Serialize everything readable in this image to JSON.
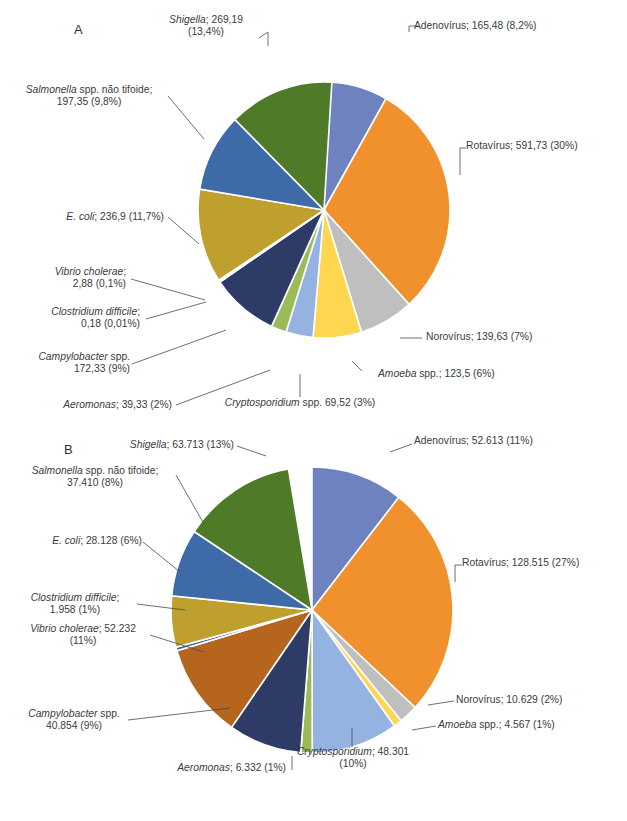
{
  "figure": {
    "background": "#ffffff",
    "caption": ""
  },
  "panels": [
    {
      "id": "A",
      "letter": "A",
      "letter_pos": {
        "x": 74,
        "y": 28
      }
    },
    {
      "id": "B",
      "letter": "B",
      "letter_pos": {
        "x": 64,
        "y": 448
      }
    }
  ],
  "chart_data": [
    {
      "type": "pie",
      "title": "A",
      "label_format": "name; value (percent)",
      "legend": "callout-labels",
      "grid": false,
      "total_percent": 100,
      "categories": [
        "Adenovírus",
        "Rotavírus",
        "Norovírus",
        "Amoeba spp.",
        "Cryptosporidium spp.",
        "Aeromonas",
        "Campylobacter spp.",
        "Clostridium difficile",
        "Vibrio cholerae",
        "E. coli",
        "Salmonella spp. não tifoide",
        "Shigella"
      ],
      "values": [
        165.48,
        591.73,
        139.63,
        123.5,
        69.52,
        39.33,
        172.33,
        0.18,
        2.88,
        236.9,
        197.35,
        269.19
      ],
      "percents": [
        "8,2%",
        "30%",
        "7%",
        "6%",
        "3%",
        "2%",
        "9%",
        "0,01%",
        "0,1%",
        "11,7%",
        "9,8%",
        "13,4%"
      ],
      "colors": [
        "#6E82C0",
        "#F0912D",
        "#BFBFBF",
        "#FFD64F",
        "#95B3E0",
        "#9BBB59",
        "#2E3B66",
        "#4F6AA0",
        "#7E98C8",
        "#BFA02E",
        "#3F6AA8",
        "#4F7B28"
      ],
      "slices": [
        {
          "name": "Adenovírus",
          "value": "165,48",
          "percent": "8,2%",
          "color": "#6E82C0",
          "sweep": 29.5
        },
        {
          "name": "Rotavírus",
          "value": "591,73",
          "percent": "30%",
          "color": "#F0912D",
          "sweep": 108.0
        },
        {
          "name": "Norovírus",
          "value": "139,63",
          "percent": "7%",
          "color": "#BFBFBF",
          "sweep": 25.2
        },
        {
          "name": "Amoeba spp.",
          "value": "123,5",
          "percent": "6%",
          "color": "#FFD64F",
          "sweep": 22.3
        },
        {
          "name": "Cryptosporidium spp.",
          "value": "69,52",
          "percent": "3%",
          "color": "#95B3E0",
          "sweep": 12.5
        },
        {
          "name": "Aeromonas",
          "value": "39,33",
          "percent": "2%",
          "color": "#9BBB59",
          "sweep": 7.1
        },
        {
          "name": "Campylobacter spp.",
          "value": "172,33",
          "percent": "9%",
          "color": "#2E3B66",
          "sweep": 31.1
        },
        {
          "name": "Clostridium difficile",
          "value": "0,18",
          "percent": "0,01%",
          "color": "#4F6AA0",
          "sweep": 0.4
        },
        {
          "name": "Vibrio cholerae",
          "value": "2,88",
          "percent": "0,1%",
          "color": "#7E98C8",
          "sweep": 0.6
        },
        {
          "name": "E. coli",
          "value": "236,9",
          "percent": "11,7%",
          "color": "#BFA02E",
          "sweep": 42.7
        },
        {
          "name": "Salmonella spp. não tifoide",
          "value": "197,35",
          "percent": "9,8%",
          "color": "#3F6AA8",
          "sweep": 35.6
        },
        {
          "name": "Shigella",
          "value": "269,19",
          "percent": "13,4%",
          "color": "#4F7B28",
          "sweep": 48.6
        }
      ],
      "labels": [
        {
          "key": "adenovirus",
          "italic": "",
          "rest": "Adenovírus; 165,48 (8,2%)",
          "lines": [
            "Adenovírus; 165,48 (8,2%)"
          ]
        },
        {
          "key": "rotavirus",
          "italic": "",
          "rest": "Rotavírus; 591,73 (30%)",
          "lines": [
            "Rotavírus; 591,73 (30%)"
          ]
        },
        {
          "key": "norovirus",
          "italic": "",
          "rest": "Norovírus; 139,63 (7%)",
          "lines": [
            "Norovírus; 139,63 (7%)"
          ]
        },
        {
          "key": "amoeba",
          "italic": "Amoeba",
          "rest": " spp.; 123,5 (6%)",
          "lines": []
        },
        {
          "key": "cryptosporidium",
          "italic": "Cryptosporidium",
          "rest": " spp. 69,52 (3%)",
          "lines": []
        },
        {
          "key": "aeromonas",
          "italic": "Aeromonas",
          "rest": "; 39,33 (2%)",
          "lines": []
        },
        {
          "key": "campylobacter",
          "italic": "Campylobacter",
          "rest": " spp.",
          "line2": "172,33 (9%)"
        },
        {
          "key": "clostridium",
          "italic": "Clostridium difficile",
          "rest": ";",
          "line2": "0,18 (0,01%)"
        },
        {
          "key": "vibrio",
          "italic": "Vibrio cholerae",
          "rest": ";",
          "line2": "2,88 (0,1%)"
        },
        {
          "key": "ecoli",
          "italic": "E. coli",
          "rest": "; 236,9 (11,7%)",
          "lines": []
        },
        {
          "key": "salmonella",
          "italic": "Salmonella",
          "rest": " spp. não tifoide;",
          "line2": "197,35 (9,8%)"
        },
        {
          "key": "shigella",
          "italic": "Shigella",
          "rest": "; 269,19",
          "line2": "(13,4%)"
        }
      ]
    },
    {
      "type": "pie",
      "title": "B",
      "label_format": "name; value (percent)",
      "legend": "callout-labels",
      "grid": false,
      "total_percent": 100,
      "categories": [
        "Adenovírus",
        "Rotavírus",
        "Norovírus",
        "Amoeba spp.",
        "Cryptosporidium",
        "Aeromonas",
        "Campylobacter spp.",
        "Vibrio cholerae",
        "Clostridium difficile",
        "E. coli",
        "Salmonella spp. não tifoide",
        "Shigella"
      ],
      "values": [
        52613,
        128515,
        10629,
        4567,
        48301,
        6332,
        40854,
        52232,
        1958,
        28128,
        37410,
        63713
      ],
      "percents": [
        "11%",
        "27%",
        "2%",
        "1%",
        "10%",
        "1%",
        "9%",
        "11%",
        "1%",
        "6%",
        "8%",
        "13%"
      ],
      "colors": [
        "#6E82C0",
        "#F0912D",
        "#BFBFBF",
        "#FFD64F",
        "#95B3E0",
        "#9BBB59",
        "#2E3B66",
        "#B5651D",
        "#3F6AA8",
        "#BFA02E",
        "#3F6AA8",
        "#4F7B28"
      ],
      "slices": [
        {
          "name": "Adenovírus",
          "value": "52.613",
          "percent": "11%",
          "color": "#6E82C0",
          "sweep": 38.0
        },
        {
          "name": "Rotavírus",
          "value": "128.515",
          "percent": "27%",
          "color": "#F0912D",
          "sweep": 95.0
        },
        {
          "name": "Norovírus",
          "value": "10.629",
          "percent": "2%",
          "color": "#BFBFBF",
          "sweep": 7.8
        },
        {
          "name": "Amoeba spp.",
          "value": "4.567",
          "percent": "1%",
          "color": "#FFD64F",
          "sweep": 3.4
        },
        {
          "name": "Cryptosporidium",
          "value": "48.301",
          "percent": "10%",
          "color": "#95B3E0",
          "sweep": 35.7
        },
        {
          "name": "Aeromonas",
          "value": "6.332",
          "percent": "1%",
          "color": "#9BBB59",
          "sweep": 4.7
        },
        {
          "name": "Campylobacter spp.",
          "value": "40.854",
          "percent": "9%",
          "color": "#2E3B66",
          "sweep": 30.2
        },
        {
          "name": "Vibrio cholerae",
          "value": "52.232",
          "percent": "11%",
          "color": "#B5651D",
          "sweep": 38.6
        },
        {
          "name": "Clostridium difficile",
          "value": "1.958",
          "percent": "1%",
          "color": "#3F6AA8",
          "sweep": 1.5
        },
        {
          "name": "E. coli",
          "value": "28.128",
          "percent": "6%",
          "color": "#BFA02E",
          "sweep": 20.8
        },
        {
          "name": "Salmonella spp. não tifoide",
          "value": "37.410",
          "percent": "8%",
          "color": "#3F6AA8",
          "sweep": 27.6
        },
        {
          "name": "Shigella",
          "value": "63.713",
          "percent": "13%",
          "color": "#4F7B28",
          "sweep": 47.1
        }
      ],
      "labels": [
        {
          "key": "adenovirus",
          "italic": "",
          "rest": "Adenovírus; 52.613 (11%)"
        },
        {
          "key": "rotavirus",
          "italic": "",
          "rest": "Rotavírus; 128.515 (27%)"
        },
        {
          "key": "norovirus",
          "italic": "",
          "rest": "Norovírus; 10.629 (2%)"
        },
        {
          "key": "amoeba",
          "italic": "Amoeba",
          "rest": " spp.; 4.567 (1%)"
        },
        {
          "key": "cryptosporidium",
          "italic": "Cryptosporidium",
          "rest": "; 48.301",
          "line2": "(10%)"
        },
        {
          "key": "aeromonas",
          "italic": "Aeromonas",
          "rest": "; 6.332 (1%)"
        },
        {
          "key": "campylobacter",
          "italic": "Campylobacter",
          "rest": " spp.",
          "line2": "40.854 (9%)"
        },
        {
          "key": "vibrio",
          "italic": "Vibrio cholerae",
          "rest": "; 52.232",
          "line2": "(11%)"
        },
        {
          "key": "clostridium",
          "italic": "Clostridium difficile",
          "rest": ";",
          "line2": "1.958 (1%)"
        },
        {
          "key": "ecoli",
          "italic": "E. coli",
          "rest": "; 28.128 (6%)"
        },
        {
          "key": "salmonella",
          "italic": "Salmonella",
          "rest": " spp. não tifoide;",
          "line2": "37.410 (8%)"
        },
        {
          "key": "shigella",
          "italic": "Shigella",
          "rest": "; 63.713 (13%)"
        }
      ]
    }
  ]
}
